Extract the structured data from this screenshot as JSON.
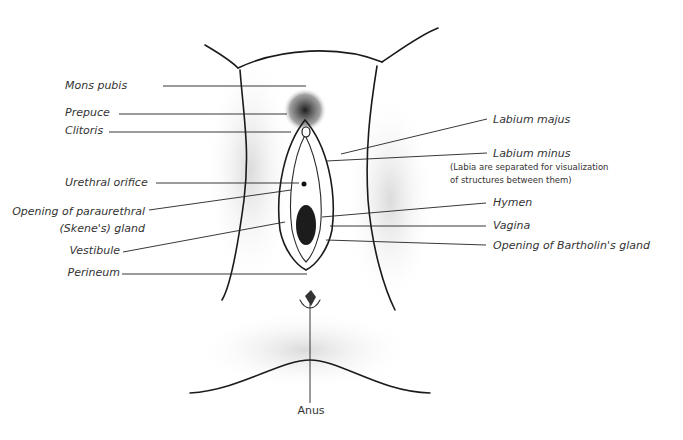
{
  "diagram": {
    "labels_left": [
      {
        "id": "mons-pubis",
        "text": "Mons pubis",
        "x": 65,
        "y": 89,
        "line": [
          163,
          86,
          306,
          86
        ]
      },
      {
        "id": "prepuce",
        "text": "Prepuce",
        "x": 65,
        "y": 116,
        "line": [
          119,
          114,
          287,
          114
        ]
      },
      {
        "id": "clitoris",
        "text": "Clitoris",
        "x": 65,
        "y": 134,
        "line": [
          109,
          132,
          291,
          132
        ]
      },
      {
        "id": "urethral-orifice",
        "text": "Urethral orifice",
        "x": 65,
        "y": 186,
        "line": [
          156,
          183,
          299,
          183
        ]
      },
      {
        "id": "paraurethral-gland",
        "text": "Opening of paraurethral",
        "text2": "(Skene's) gland",
        "x": 145,
        "y": 215,
        "y2": 232,
        "line": [
          149,
          210,
          291,
          190
        ]
      },
      {
        "id": "vestibule",
        "text": "Vestibule",
        "x": 120,
        "y": 254,
        "line": [
          123,
          252,
          285,
          222
        ]
      },
      {
        "id": "perineum",
        "text": "Perineum",
        "x": 120,
        "y": 276,
        "line": [
          122,
          274,
          307,
          274
        ]
      }
    ],
    "labels_right": [
      {
        "id": "labium-majus",
        "text": "Labium majus",
        "x": 493,
        "y": 123,
        "line": [
          487,
          119,
          341,
          154
        ]
      },
      {
        "id": "labium-minus",
        "text": "Labium minus",
        "x": 493,
        "y": 157,
        "line": [
          487,
          153,
          326,
          161
        ]
      },
      {
        "id": "hymen",
        "text": "Hymen",
        "x": 493,
        "y": 206,
        "line": [
          486,
          203,
          322,
          217
        ]
      },
      {
        "id": "vagina",
        "text": "Vagina",
        "x": 493,
        "y": 229,
        "line": [
          486,
          226,
          330,
          226
        ]
      },
      {
        "id": "bartholin-gland",
        "text": "Opening of Bartholin's gland",
        "x": 493,
        "y": 249,
        "line": [
          486,
          245,
          326,
          240
        ]
      }
    ],
    "label_bottom": {
      "id": "anus",
      "text": "Anus",
      "x": 311,
      "y": 414,
      "line": [
        310,
        304,
        310,
        403
      ]
    },
    "note": {
      "line1": "(Labia are separated for visualization",
      "line2": "of structures between them)",
      "x": 450,
      "y": 170,
      "y2": 183
    },
    "colors": {
      "text": "#333333",
      "leader": "#222222",
      "outline": "#1a1a1a",
      "shade_dark": "#2b2b2b",
      "shade_mid": "#9a9a9a",
      "shade_light": "#d9d9d9"
    }
  }
}
